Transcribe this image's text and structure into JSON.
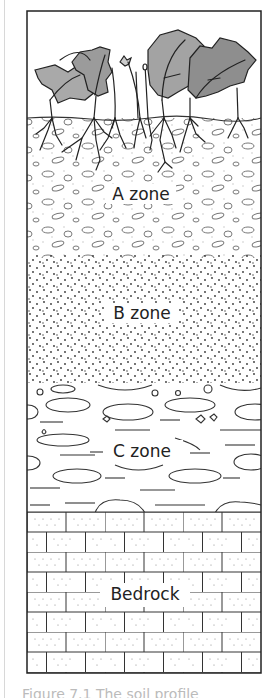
{
  "diagram": {
    "title": "Soil profile",
    "zones": [
      {
        "id": "a",
        "label": "A zone"
      },
      {
        "id": "b",
        "label": "B zone"
      },
      {
        "id": "c",
        "label": "C zone"
      },
      {
        "id": "bedrock",
        "label": "Bedrock"
      }
    ],
    "colors": {
      "outline": "#222222",
      "leaf_light": "#a9a9a9",
      "leaf_dark": "#8e8e8e",
      "background": "#ffffff"
    },
    "caption": "Figure 7.1 The soil profile"
  }
}
